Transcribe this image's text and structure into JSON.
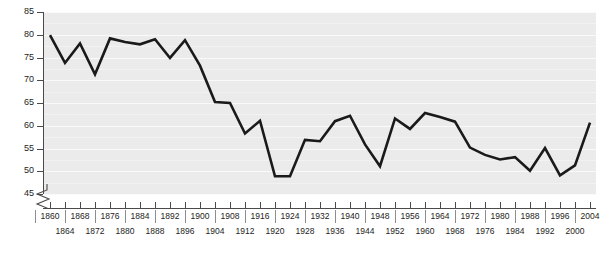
{
  "chart_data": {
    "type": "line",
    "title": "",
    "xlabel": "",
    "ylabel": "Percentage of voters participating",
    "ylim": [
      45,
      85
    ],
    "ytick_values": [
      45,
      50,
      55,
      60,
      65,
      70,
      75,
      80,
      85
    ],
    "ytick_labels": [
      "45",
      "50",
      "55",
      "60",
      "65",
      "70",
      "75",
      "80",
      "85"
    ],
    "y_axis_break": true,
    "grid": true,
    "legend": false,
    "line_color": "#1a1a1a",
    "plot_background": "#ebebeb",
    "gridline_color": "#fafafa",
    "x": [
      1860,
      1864,
      1868,
      1872,
      1876,
      1880,
      1884,
      1888,
      1892,
      1896,
      1900,
      1904,
      1908,
      1912,
      1916,
      1920,
      1924,
      1928,
      1932,
      1936,
      1940,
      1944,
      1948,
      1952,
      1956,
      1960,
      1964,
      1968,
      1972,
      1976,
      1980,
      1984,
      1988,
      1992,
      1996,
      2000,
      2004
    ],
    "values": [
      79.9,
      73.8,
      78.1,
      71.3,
      79.2,
      78.4,
      77.9,
      79.0,
      74.9,
      78.8,
      73.2,
      65.2,
      65.0,
      58.3,
      61.1,
      48.9,
      48.9,
      56.9,
      56.6,
      61.0,
      62.2,
      55.9,
      51.1,
      61.6,
      59.3,
      62.8,
      61.9,
      60.9,
      55.2,
      53.6,
      52.6,
      53.1,
      50.1,
      55.1,
      49.1,
      51.3,
      60.7
    ],
    "xtick_labels": [
      "1860",
      "1864",
      "1868",
      "1872",
      "1876",
      "1880",
      "1884",
      "1888",
      "1892",
      "1896",
      "1900",
      "1904",
      "1908",
      "1912",
      "1916",
      "1920",
      "1924",
      "1928",
      "1932",
      "1936",
      "1940",
      "1944",
      "1948",
      "1952",
      "1956",
      "1960",
      "1964",
      "1968",
      "1972",
      "1976",
      "1980",
      "1984",
      "1988",
      "1992",
      "1996",
      "2000",
      "2004"
    ]
  }
}
